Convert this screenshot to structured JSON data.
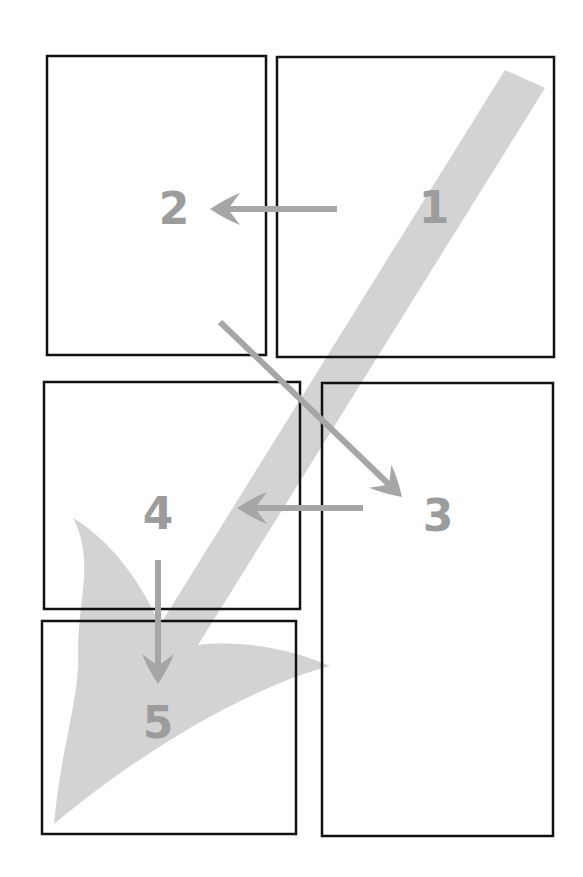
{
  "diagram": {
    "type": "reading-order-layout",
    "colors": {
      "background": "#ffffff",
      "box_stroke": "#111111",
      "band_fill": "#d3d3d3",
      "arrow": "#a6a6a6",
      "label": "#9c9c9c"
    },
    "panels": [
      {
        "id": "1",
        "label": "1",
        "x": 277,
        "y": 57,
        "w": 277,
        "h": 300,
        "label_x": 434,
        "label_y": 208
      },
      {
        "id": "2",
        "label": "2",
        "x": 47,
        "y": 56,
        "w": 219,
        "h": 299,
        "label_x": 174,
        "label_y": 209
      },
      {
        "id": "3",
        "label": "3",
        "x": 322,
        "y": 383,
        "w": 231,
        "h": 453,
        "label_x": 438,
        "label_y": 516
      },
      {
        "id": "4",
        "label": "4",
        "x": 44,
        "y": 382,
        "w": 256,
        "h": 227,
        "label_x": 158,
        "label_y": 514
      },
      {
        "id": "5",
        "label": "5",
        "x": 42,
        "y": 621,
        "w": 254,
        "h": 213,
        "label_x": 158,
        "label_y": 723
      }
    ],
    "arrows": [
      {
        "from": "1",
        "to": "2",
        "x1": 337,
        "y1": 209,
        "x2": 210,
        "y2": 209
      },
      {
        "from": "2",
        "to": "3",
        "x1": 220,
        "y1": 322,
        "x2": 402,
        "y2": 497
      },
      {
        "from": "3",
        "to": "4",
        "x1": 363,
        "y1": 508,
        "x2": 237,
        "y2": 508
      },
      {
        "from": "4",
        "to": "5",
        "x1": 158,
        "y1": 560,
        "x2": 158,
        "y2": 684
      }
    ],
    "overall_flow_arrow": {
      "from": "top-right",
      "to": "bottom-left",
      "tail": [
        525,
        79
      ],
      "tip": [
        54,
        824
      ]
    }
  }
}
